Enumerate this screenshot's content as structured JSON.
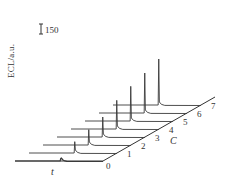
{
  "chart_data": {
    "type": "line",
    "subtype": "3d-waterfall",
    "title": "",
    "xlabel": "t",
    "ylabel": "ECL/a.u.",
    "zlabel": "C",
    "scale_bar": {
      "label": "150",
      "units": "a.u."
    },
    "z_ticks": [
      "0",
      "1",
      "2",
      "3",
      "4",
      "5",
      "6",
      "7"
    ],
    "grid": false,
    "legend": null,
    "series": [
      {
        "name": "0",
        "peak_height": 40
      },
      {
        "name": "1",
        "peak_height": 170
      },
      {
        "name": "2",
        "peak_height": 230
      },
      {
        "name": "3",
        "peak_height": 300
      },
      {
        "name": "4",
        "peak_height": 430
      },
      {
        "name": "5",
        "peak_height": 520
      },
      {
        "name": "6",
        "peak_height": 600
      },
      {
        "name": "7",
        "peak_height": 690
      }
    ]
  },
  "labels": {
    "ylabel": "ECL/a.u.",
    "scale": "150",
    "xlabel": "t",
    "clabel": "C"
  },
  "colors": {
    "line": "#3a3a3a",
    "text": "#333333",
    "background": "#ffffff"
  }
}
